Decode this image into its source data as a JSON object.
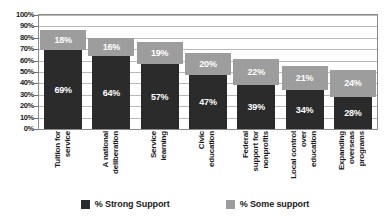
{
  "chart_data": {
    "type": "bar",
    "subtype": "stacked-vertical",
    "title": "",
    "subtitle": "",
    "xlabel": "",
    "ylabel": "",
    "ylim": [
      0,
      100
    ],
    "ytick_labels": [
      "100%",
      "90%",
      "80%",
      "70%",
      "60%",
      "50%",
      "40%",
      "30%",
      "20%",
      "10%",
      "0%"
    ],
    "ytick_values": [
      100,
      90,
      80,
      70,
      60,
      50,
      40,
      30,
      20,
      10,
      0
    ],
    "grid": true,
    "grid_axis": "y",
    "legend_position": "bottom-center",
    "categories": [
      "Tuition for service",
      "A national deliberation",
      "Service learning",
      "Civic education",
      "Federal support for nonprofits",
      "Local control over education",
      "Expanding overseas programs"
    ],
    "category_lines": [
      [
        "Tuition for",
        "service"
      ],
      [
        "A national",
        "deliberation"
      ],
      [
        "Service",
        "learning"
      ],
      [
        "Civic",
        "education"
      ],
      [
        "Federal",
        "support for",
        "nonprofits"
      ],
      [
        "Local control",
        "over",
        "education"
      ],
      [
        "Expanding",
        "overseas",
        "programs"
      ]
    ],
    "series": [
      {
        "name": "% Strong Support",
        "color": "#2b2b2b",
        "values": [
          69,
          64,
          57,
          47,
          39,
          34,
          28
        ],
        "labels": [
          "69%",
          "64%",
          "57%",
          "47%",
          "39%",
          "34%",
          "28%"
        ]
      },
      {
        "name": "% Some support",
        "color": "#9d9d9d",
        "values": [
          18,
          16,
          19,
          20,
          22,
          21,
          24
        ],
        "labels": [
          "18%",
          "16%",
          "19%",
          "20%",
          "22%",
          "21%",
          "24%"
        ]
      }
    ],
    "totals": [
      87,
      80,
      76,
      67,
      61,
      55,
      52
    ]
  },
  "legend": {
    "items": [
      {
        "label": "% Strong Support",
        "color": "#2b2b2b"
      },
      {
        "label": "% Some support",
        "color": "#9d9d9d"
      }
    ]
  }
}
